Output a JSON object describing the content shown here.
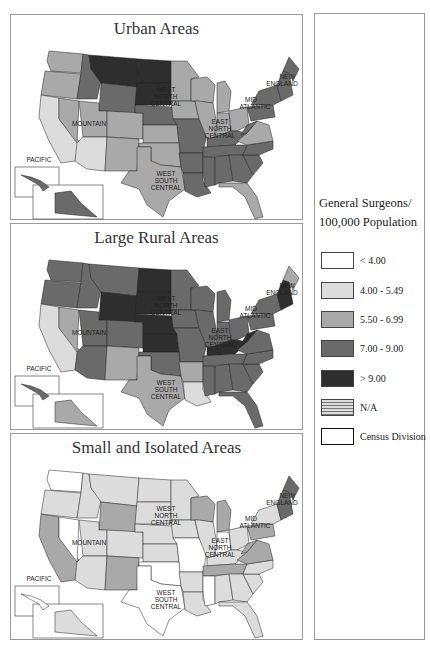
{
  "legend": {
    "title_line1": "General Surgeons/",
    "title_line2": "100,000 Population",
    "items": [
      {
        "label": "< 4.00",
        "color": "#ffffff",
        "key": "c0"
      },
      {
        "label": "4.00 - 5.49",
        "color": "#dcdcdc",
        "key": "c1"
      },
      {
        "label": "5.50 - 6.99",
        "color": "#a9a9a9",
        "key": "c2"
      },
      {
        "label": "7.00 - 9.00",
        "color": "#6a6a6a",
        "key": "c3"
      },
      {
        "label": "> 9.00",
        "color": "#2e2e2e",
        "key": "c4"
      },
      {
        "label": "N/A",
        "color": "hatch",
        "key": "na"
      },
      {
        "label": "Census Division",
        "color": "#ffffff",
        "key": "div"
      }
    ]
  },
  "colors": {
    "c0": "#ffffff",
    "c1": "#dcdcdc",
    "c2": "#a9a9a9",
    "c3": "#6a6a6a",
    "c4": "#2e2e2e"
  },
  "division_labels": [
    {
      "text": "PACIFIC",
      "x": 28,
      "y": 143
    },
    {
      "text": "MOUNTAIN",
      "x": 78,
      "y": 107
    },
    {
      "text": "WEST",
      "x": 155,
      "y": 73
    },
    {
      "text": "NORTH",
      "x": 155,
      "y": 80
    },
    {
      "text": "CENTRAL",
      "x": 155,
      "y": 87
    },
    {
      "text": "WEST",
      "x": 155,
      "y": 157
    },
    {
      "text": "SOUTH",
      "x": 155,
      "y": 164
    },
    {
      "text": "CENTRAL",
      "x": 155,
      "y": 171
    },
    {
      "text": "EAST",
      "x": 209,
      "y": 105
    },
    {
      "text": "NORTH",
      "x": 209,
      "y": 112
    },
    {
      "text": "CENTRAL",
      "x": 209,
      "y": 119
    },
    {
      "text": "MID",
      "x": 240,
      "y": 83
    },
    {
      "text": "ATLANTIC",
      "x": 244,
      "y": 90
    },
    {
      "text": "NEW",
      "x": 276,
      "y": 60
    },
    {
      "text": "ENGLAND",
      "x": 271,
      "y": 67
    }
  ],
  "maps": [
    {
      "title": "Urban Areas",
      "states": {
        "WA": "c2",
        "OR": "c2",
        "CA": "c1",
        "ID": "c3",
        "NV": "c2",
        "MT": "c4",
        "WY": "c3",
        "UT": "c2",
        "AZ": "c1",
        "CO": "c2",
        "NM": "c2",
        "ND": "c4",
        "SD": "c4",
        "NE": "c3",
        "KS": "c2",
        "MN": "c2",
        "IA": "c2",
        "MO": "c3",
        "TX": "c2",
        "OK": "c2",
        "AR": "c3",
        "LA": "c3",
        "WI": "c2",
        "IL": "c2",
        "MI": "c2",
        "IN": "c2",
        "OH": "c2",
        "KY": "c3",
        "TN": "c3",
        "MS": "c3",
        "AL": "c3",
        "GA": "c3",
        "FL": "c2",
        "SC": "c3",
        "NC": "c3",
        "VA": "c2",
        "WV": "c3",
        "PA": "c3",
        "NY": "c3",
        "NE_ENG": "c3",
        "ME": "c3",
        "AK": "c3",
        "HI": "c3"
      }
    },
    {
      "title": "Large Rural Areas",
      "states": {
        "WA": "c3",
        "OR": "c3",
        "CA": "c1",
        "ID": "c3",
        "NV": "c2",
        "MT": "c3",
        "WY": "c4",
        "UT": "c3",
        "AZ": "c3",
        "CO": "c3",
        "NM": "c2",
        "ND": "c4",
        "SD": "c4",
        "NE": "c4",
        "KS": "c4",
        "MN": "c3",
        "IA": "c3",
        "MO": "c3",
        "TX": "c2",
        "OK": "c3",
        "AR": "c2",
        "LA": "c1",
        "WI": "c3",
        "IL": "c3",
        "MI": "c3",
        "IN": "c3",
        "OH": "c3",
        "KY": "c4",
        "TN": "c3",
        "MS": "c3",
        "AL": "c3",
        "GA": "c3",
        "FL": "c3",
        "SC": "c3",
        "NC": "c3",
        "VA": "c3",
        "WV": "c4",
        "PA": "c3",
        "NY": "c3",
        "NE_ENG": "c4",
        "ME": "c2",
        "AK": "c2",
        "HI": "c3"
      }
    },
    {
      "title": "Small and Isolated Areas",
      "states": {
        "WA": "c0",
        "OR": "c1",
        "CA": "c2",
        "ID": "c1",
        "NV": "c0",
        "MT": "c1",
        "WY": "c2",
        "UT": "c1",
        "AZ": "c1",
        "CO": "c1",
        "NM": "c2",
        "ND": "c1",
        "SD": "c1",
        "NE": "c1",
        "KS": "c1",
        "MN": "c1",
        "IA": "c1",
        "MO": "c0",
        "TX": "c0",
        "OK": "c0",
        "AR": "c1",
        "LA": "c1",
        "WI": "c2",
        "IL": "c1",
        "MI": "c2",
        "IN": "c0",
        "OH": "c1",
        "KY": "c1",
        "TN": "c2",
        "MS": "c0",
        "AL": "c1",
        "GA": "c1",
        "FL": "c1",
        "SC": "c1",
        "NC": "c1",
        "VA": "c2",
        "WV": "c2",
        "PA": "c2",
        "NY": "c1",
        "NE_ENG": "c3",
        "ME": "c3",
        "AK": "c1",
        "HI": "c0"
      }
    }
  ]
}
